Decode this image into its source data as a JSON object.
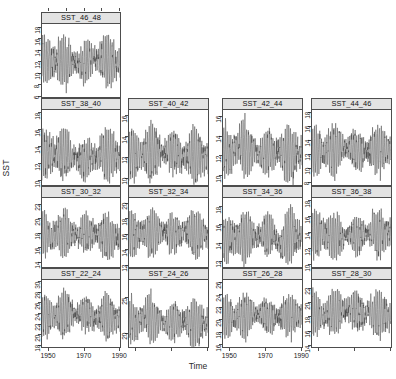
{
  "figure": {
    "ylabel": "SST",
    "xlabel": "Time",
    "panel_count": 13,
    "line_color": "#3a3a3a",
    "strip_bg": "#e3e3e3",
    "border_color": "#4d4d4d"
  },
  "chart_data": {
    "type": "line",
    "title": "",
    "subtitle": "",
    "xlabel": "Time",
    "ylabel": "SST",
    "grid": false,
    "legend_position": "none",
    "layout": "4x4 trellis, 13 panels, row 1 single panel",
    "xlim": [
      1946,
      1991
    ],
    "x_ticks": [
      1950,
      1970,
      1990
    ],
    "x_tick_labels": [
      "1950",
      "1970",
      "1990"
    ],
    "panels": [
      {
        "label": "SST_46_48",
        "row": 1,
        "col": 1,
        "ylim": [
          5.6,
          18.6
        ],
        "y_ticks": [
          6,
          8,
          10,
          12,
          14,
          16,
          18
        ],
        "y_tick_labels": [
          "6",
          "8",
          "10",
          "12",
          "14",
          "16",
          "18"
        ],
        "mean": 12.2,
        "amplitude": 3.4,
        "series": [
          {
            "name": "SST_46_48",
            "x_start": 1946,
            "x_end": 1991,
            "n": 540,
            "min": 6.1,
            "max": 18.3
          }
        ]
      },
      {
        "label": "SST_38_40",
        "row": 2,
        "col": 1,
        "ylim": [
          9.3,
          18.4
        ],
        "y_ticks": [
          10,
          12,
          14,
          16,
          18
        ],
        "y_tick_labels": [
          "10",
          "12",
          "14",
          "16",
          "18"
        ],
        "mean": 12.9,
        "amplitude": 2.3,
        "series": [
          {
            "name": "SST_38_40",
            "x_start": 1946,
            "x_end": 1991,
            "n": 540,
            "min": 9.6,
            "max": 18.1
          }
        ]
      },
      {
        "label": "SST_40_42",
        "row": 2,
        "col": 2,
        "ylim": [
          9.2,
          16.6
        ],
        "y_ticks": [
          10,
          12,
          14,
          16
        ],
        "y_tick_labels": [
          "10",
          "12",
          "14",
          "16"
        ],
        "mean": 12.3,
        "amplitude": 2.0,
        "series": [
          {
            "name": "SST_40_42",
            "x_start": 1946,
            "x_end": 1991,
            "n": 540,
            "min": 9.3,
            "max": 16.5
          }
        ]
      },
      {
        "label": "SST_42_44",
        "row": 2,
        "col": 3,
        "ylim": [
          8.9,
          16.7
        ],
        "y_ticks": [
          10,
          12,
          14,
          16
        ],
        "y_tick_labels": [
          "10",
          "12",
          "14",
          "16"
        ],
        "mean": 12.4,
        "amplitude": 2.1,
        "series": [
          {
            "name": "SST_42_44",
            "x_start": 1946,
            "x_end": 1991,
            "n": 540,
            "min": 9.0,
            "max": 16.6
          }
        ]
      },
      {
        "label": "SST_44_46",
        "row": 2,
        "col": 4,
        "ylim": [
          7.4,
          18.4
        ],
        "y_ticks": [
          8,
          10,
          12,
          14,
          16,
          18
        ],
        "y_tick_labels": [
          "8",
          "10",
          "12",
          "14",
          "16",
          "18"
        ],
        "mean": 12.3,
        "amplitude": 2.8,
        "series": [
          {
            "name": "SST_44_46",
            "x_start": 1946,
            "x_end": 1991,
            "n": 540,
            "min": 7.6,
            "max": 18.2
          }
        ]
      },
      {
        "label": "SST_30_32",
        "row": 3,
        "col": 1,
        "ylim": [
          13.1,
          22.9
        ],
        "y_ticks": [
          14,
          16,
          18,
          20,
          22
        ],
        "y_tick_labels": [
          "14",
          "16",
          "18",
          "20",
          "22"
        ],
        "mean": 17.7,
        "amplitude": 2.4,
        "series": [
          {
            "name": "SST_30_32",
            "x_start": 1946,
            "x_end": 1991,
            "n": 540,
            "min": 13.3,
            "max": 22.7
          }
        ]
      },
      {
        "label": "SST_32_34",
        "row": 3,
        "col": 2,
        "ylim": [
          11.6,
          20.7
        ],
        "y_ticks": [
          12,
          14,
          16,
          18,
          20
        ],
        "y_tick_labels": [
          "12",
          "14",
          "16",
          "18",
          "20"
        ],
        "mean": 15.9,
        "amplitude": 2.3,
        "series": [
          {
            "name": "SST_32_34",
            "x_start": 1946,
            "x_end": 1991,
            "n": 540,
            "min": 11.8,
            "max": 20.6
          }
        ]
      },
      {
        "label": "SST_34_36",
        "row": 3,
        "col": 3,
        "ylim": [
          11.2,
          19.0
        ],
        "y_ticks": [
          12,
          14,
          16,
          18
        ],
        "y_tick_labels": [
          "12",
          "14",
          "16",
          "18"
        ],
        "mean": 14.6,
        "amplitude": 2.1,
        "series": [
          {
            "name": "SST_34_36",
            "x_start": 1946,
            "x_end": 1991,
            "n": 540,
            "min": 11.4,
            "max": 18.9
          }
        ]
      },
      {
        "label": "SST_36_38",
        "row": 3,
        "col": 4,
        "ylim": [
          9.5,
          18.4
        ],
        "y_ticks": [
          10,
          12,
          14,
          16,
          18
        ],
        "y_tick_labels": [
          "10",
          "12",
          "14",
          "16",
          "18"
        ],
        "mean": 13.7,
        "amplitude": 2.3,
        "series": [
          {
            "name": "SST_36_38",
            "x_start": 1946,
            "x_end": 1991,
            "n": 540,
            "min": 9.8,
            "max": 18.2
          }
        ]
      },
      {
        "label": "SST_22_24",
        "row": 4,
        "col": 1,
        "ylim": [
          17.4,
          30.4
        ],
        "y_ticks": [
          18,
          20,
          22,
          24,
          26,
          28,
          30
        ],
        "y_tick_labels": [
          "18",
          "20",
          "22",
          "24",
          "26",
          "28",
          "30"
        ],
        "mean": 23.6,
        "amplitude": 3.2,
        "series": [
          {
            "name": "SST_22_24",
            "x_start": 1946,
            "x_end": 1991,
            "n": 540,
            "min": 17.7,
            "max": 30.2
          }
        ]
      },
      {
        "label": "SST_24_26",
        "row": 4,
        "col": 2,
        "ylim": [
          17.8,
          27.6
        ],
        "y_ticks": [
          20,
          25
        ],
        "y_tick_labels": [
          "20",
          "25"
        ],
        "mean": 21.6,
        "amplitude": 2.5,
        "series": [
          {
            "name": "SST_24_26",
            "x_start": 1946,
            "x_end": 1991,
            "n": 540,
            "min": 18.0,
            "max": 27.4
          }
        ]
      },
      {
        "label": "SST_26_28",
        "row": 4,
        "col": 3,
        "ylim": [
          15.4,
          26.4
        ],
        "y_ticks": [
          16,
          18,
          20,
          22,
          24,
          26
        ],
        "y_tick_labels": [
          "16",
          "18",
          "20",
          "22",
          "24",
          "26"
        ],
        "mean": 20.3,
        "amplitude": 2.7,
        "series": [
          {
            "name": "SST_26_28",
            "x_start": 1946,
            "x_end": 1991,
            "n": 540,
            "min": 15.6,
            "max": 26.2
          }
        ]
      },
      {
        "label": "SST_28_30",
        "row": 4,
        "col": 4,
        "ylim": [
          13.6,
          23.2
        ],
        "y_ticks": [
          14,
          16,
          18,
          20,
          22
        ],
        "y_tick_labels": [
          "14",
          "16",
          "18",
          "20",
          "22"
        ],
        "mean": 18.3,
        "amplitude": 2.5,
        "series": [
          {
            "name": "SST_28_30",
            "x_start": 1946,
            "x_end": 1991,
            "n": 540,
            "min": 13.8,
            "max": 23.0
          }
        ]
      }
    ]
  }
}
